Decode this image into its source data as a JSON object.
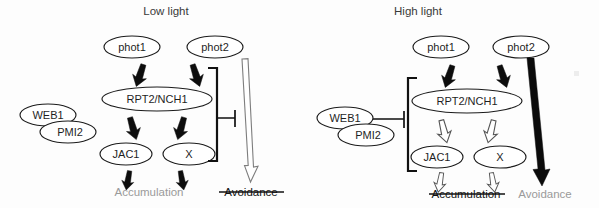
{
  "figure": {
    "caption_present": false,
    "panels": [
      {
        "id": "low-light",
        "title": "Low light",
        "nodes": {
          "phot1": "phot1",
          "phot2": "phot2",
          "hub": "RPT2/NCH1",
          "web1": "WEB1",
          "pmi2": "PMI2",
          "jac1": "JAC1",
          "x": "X"
        },
        "outcomes": {
          "accumulation": {
            "label": "Accumulation",
            "state": "active",
            "struck": false,
            "color": "#9a9a9a"
          },
          "avoidance": {
            "label": "Avoidance",
            "state": "inactive",
            "struck": true,
            "color": "#111111"
          }
        },
        "edges": {
          "phot1_to_hub": "solid-arrow",
          "phot2_to_hub": "solid-arrow",
          "hub_to_jac1": "solid-arrow",
          "hub_to_x": "solid-arrow",
          "jac1_to_accumulation": "solid-arrow",
          "x_to_accumulation": "solid-arrow",
          "phot2_to_avoidance": "hollow-arrow",
          "bracket_inhibits_avoidance": "t-bar"
        }
      },
      {
        "id": "high-light",
        "title": "High light",
        "nodes": {
          "phot1": "phot1",
          "phot2": "phot2",
          "hub": "RPT2/NCH1",
          "web1": "WEB1",
          "pmi2": "PMI2",
          "jac1": "JAC1",
          "x": "X"
        },
        "outcomes": {
          "accumulation": {
            "label": "Accumulation",
            "state": "inactive",
            "struck": true,
            "color": "#111111"
          },
          "avoidance": {
            "label": "Avoidance",
            "state": "active",
            "struck": false,
            "color": "#9a9a9a"
          }
        },
        "edges": {
          "phot1_to_hub": "solid-arrow",
          "phot2_to_hub": "solid-arrow",
          "hub_to_jac1": "hollow-arrow",
          "hub_to_x": "hollow-arrow",
          "jac1_to_accumulation": "hollow-arrow",
          "x_to_accumulation": "hollow-arrow",
          "phot2_to_avoidance": "solid-arrow",
          "web1pmi2_inhibits_bracket": "t-bar"
        }
      }
    ],
    "colors": {
      "stroke": "#1c1c1c",
      "active_outcome": "#9a9a9a",
      "inactive_outcome": "#111111",
      "background": "#fdfdfd"
    }
  }
}
